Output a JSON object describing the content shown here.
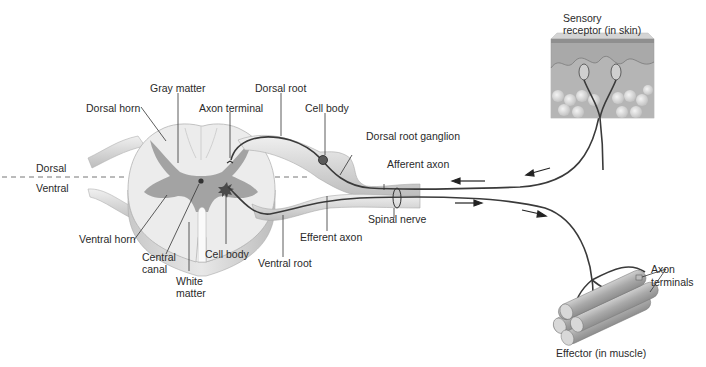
{
  "figure": {
    "orientation": {
      "dorsal": "Dorsal",
      "ventral": "Ventral"
    },
    "labels": {
      "gray_matter": "Gray matter",
      "dorsal_horn": "Dorsal horn",
      "dorsal_root": "Dorsal root",
      "axon_terminal": "Axon terminal",
      "cell_body_dorsal": "Cell body",
      "dorsal_root_ganglion": "Dorsal root ganglion",
      "afferent_axon": "Afferent axon",
      "spinal_nerve": "Spinal nerve",
      "efferent_axon": "Efferent axon",
      "ventral_root": "Ventral root",
      "cell_body_ventral": "Cell body",
      "ventral_horn": "Ventral horn",
      "central_canal_1": "Central",
      "central_canal_2": "canal",
      "white_matter_1": "White",
      "white_matter_2": "matter",
      "sensory_receptor_1": "Sensory",
      "sensory_receptor_2": "receptor (in skin)",
      "axon_terminals_1": "Axon",
      "axon_terminals_2": "terminals",
      "effector": "Effector (in muscle)"
    },
    "colors": {
      "gray_matter": "#9a9a9a",
      "white_matter": "#e6e6e6",
      "nerve": "#d8d8d8",
      "axon": "#3a3a3a",
      "skin_top": "#b8b8b8",
      "skin_dermis": "#a8a8a8",
      "fat": "#d0d0d0",
      "muscle": "#a6a6a6"
    }
  }
}
